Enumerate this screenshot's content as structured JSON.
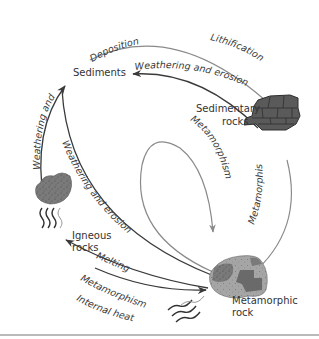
{
  "diagram": {
    "nodes": [
      {
        "id": "sediments",
        "label": "Sediments"
      },
      {
        "id": "sedimentary",
        "label_line1": "Sedimentary",
        "label_line2": "rocks"
      },
      {
        "id": "igneous",
        "label_line1": "Igneous",
        "label_line2": "rocks"
      },
      {
        "id": "metamorphic",
        "label_line1": "Metamorphic",
        "label_line2": "rock"
      }
    ],
    "processes": {
      "deposition": "Deposition",
      "lithification": "Lithification",
      "weathering_top": "Weathering and erosion",
      "weathering_left": "Weathering and erosion",
      "weathering_diag": "Weathering and erosion",
      "metamorphism_inner": "Metamorphism",
      "metamorphism_right": "Metamorphism",
      "melting": "Melting",
      "metamorphism_bottom": "Metamorphism",
      "internal_heat": "Internal heat"
    },
    "edges": [
      {
        "from": "sediments",
        "to": "sedimentary",
        "labels": [
          "Deposition",
          "Lithification"
        ]
      },
      {
        "from": "sedimentary",
        "to": "sediments",
        "label": "Weathering and erosion"
      },
      {
        "from": "igneous",
        "to": "sediments",
        "label": "Weathering and erosion"
      },
      {
        "from": "metamorphic",
        "to": "sediments",
        "label": "Weathering and erosion"
      },
      {
        "from": "sedimentary",
        "to": "metamorphic",
        "label": "Metamorphism"
      },
      {
        "from": "metamorphic",
        "to": "metamorphic",
        "label": "Metamorphism"
      },
      {
        "from": "metamorphic",
        "to": "igneous",
        "label": "Melting"
      },
      {
        "from": "igneous",
        "to": "metamorphic",
        "labels": [
          "Metamorphism",
          "Internal heat"
        ]
      }
    ],
    "colors": {
      "dark_arrow": "#3a3a3a",
      "gray_arrow": "#8a8a8a",
      "rock_dark": "#555555",
      "rock_mid": "#777777",
      "rock_light": "#a8a8a8"
    }
  }
}
